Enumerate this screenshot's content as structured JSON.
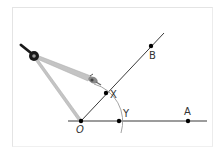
{
  "diagram": {
    "type": "geometric-construction",
    "colors": {
      "line": "#3a3a3a",
      "arc": "#9a9a9a",
      "point": "#000000",
      "compass_leg": "#b8b8b8",
      "compass_head": "#1a1a1a",
      "frame": "#e4e4e4"
    },
    "points": [
      {
        "id": "O",
        "label": "O",
        "x": 81,
        "y": 121
      },
      {
        "id": "Y",
        "label": "Y",
        "x": 119,
        "y": 121
      },
      {
        "id": "A",
        "label": "A",
        "x": 188,
        "y": 121
      },
      {
        "id": "X",
        "label": "X",
        "x": 106,
        "y": 93
      },
      {
        "id": "B",
        "label": "B",
        "x": 151,
        "y": 46
      }
    ],
    "labels": {
      "O": "O",
      "Y": "Y",
      "A": "A",
      "X": "X",
      "B": "B"
    },
    "rays": [
      {
        "name": "OA",
        "from": "O",
        "through": "A"
      },
      {
        "name": "OB",
        "from": "O",
        "through": "B"
      }
    ],
    "arc": {
      "center": "O",
      "radius_through": [
        "X",
        "Y"
      ]
    },
    "tool": "compass-icon"
  }
}
